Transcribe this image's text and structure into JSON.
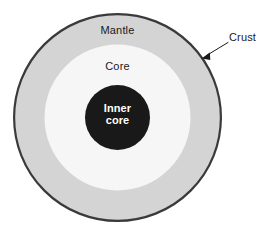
{
  "diagram": {
    "type": "concentric-circles-cross-section",
    "background_color": "#ffffff",
    "labels": {
      "crust": "Crust",
      "mantle": "Mantle",
      "core": "Core",
      "inner_core_line1": "Inner",
      "inner_core_line2": "core"
    },
    "layers": [
      {
        "name": "crust",
        "label": "Crust",
        "shape": "ring-outline",
        "center_x": 117.5,
        "center_y": 117.5,
        "radius": 103.5,
        "stroke_color": "#3a3a3a",
        "stroke_width": 2.2,
        "fill_color": "none",
        "label_placement": "outside-right-with-arrow"
      },
      {
        "name": "mantle",
        "label": "Mantle",
        "shape": "circle",
        "center_x": 117.5,
        "center_y": 117.5,
        "radius": 103.5,
        "fill_color": "#d4d4d4",
        "label_placement": "inside-top"
      },
      {
        "name": "core",
        "label": "Core",
        "shape": "circle",
        "center_x": 117.5,
        "center_y": 117.5,
        "radius": 73,
        "fill_color": "#f6f6f6",
        "label_placement": "inside-top"
      },
      {
        "name": "inner-core",
        "label": "Inner core",
        "shape": "circle",
        "center_x": 117.5,
        "center_y": 117.5,
        "radius": 32.5,
        "fill_color": "#191919",
        "text_color": "#ffffff",
        "label_placement": "inside-center"
      }
    ],
    "leader_line": {
      "name": "crust-arrow",
      "from_x": 228,
      "from_y": 42.5,
      "to_x": 203,
      "to_y": 57.5,
      "stroke_color": "#1a1a1a",
      "stroke_width": 1,
      "arrowhead": "filled-triangle",
      "points_to": "crust"
    }
  }
}
